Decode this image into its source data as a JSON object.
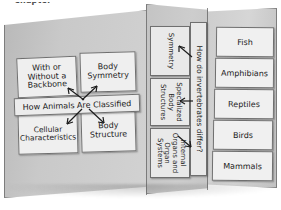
{
  "caption": {
    "text": "Chapter"
  },
  "board": {
    "kind": "trifold-display-board",
    "colors": {
      "panel_left": "#c9c9c9",
      "panel_center": "#cdcdcd",
      "panel_right": "#d6d6d6",
      "card": "#efefef",
      "outline": "#6f6f6f",
      "ink": "#1d1d1d"
    }
  },
  "left_panel": {
    "name": "how-animals-are-classified",
    "banner": "How Animals Are Classified",
    "cards": [
      {
        "id": "backbone",
        "label": "With or\nWithout a\nBackbone"
      },
      {
        "id": "symmetry",
        "label": "Body\nSymmetry"
      },
      {
        "id": "cellular",
        "label": "Cellular\nCharacteristics"
      },
      {
        "id": "structure",
        "label": "Body\nStructure"
      }
    ],
    "arrows": 4
  },
  "center_panel": {
    "name": "how-do-invertebrates-differ",
    "heading": "How do invertebrates differ?",
    "cards": [
      {
        "id": "symmetry",
        "label": "Symmetry"
      },
      {
        "id": "specialized",
        "label": "Specialized\nBody\nStructures"
      },
      {
        "id": "internal-organs",
        "label": "Internal\nOrgans and\nOrgan\nSystems"
      }
    ],
    "arrows": 3
  },
  "right_panel": {
    "name": "vertebrate-groups",
    "cards": [
      {
        "id": "fish",
        "label": "Fish"
      },
      {
        "id": "amphibians",
        "label": "Amphibians"
      },
      {
        "id": "reptiles",
        "label": "Reptiles"
      },
      {
        "id": "birds",
        "label": "Birds"
      },
      {
        "id": "mammals",
        "label": "Mammals"
      }
    ]
  }
}
